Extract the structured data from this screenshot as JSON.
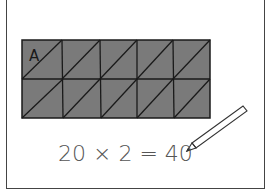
{
  "diagram": {
    "grid": {
      "rows": 2,
      "cols": 5,
      "fill": "#7a7a7a",
      "stroke": "#1a1a1a",
      "label": "A",
      "diagonal": "bottom-left to top-right in every cell"
    },
    "equation": "20 × 2 = 40",
    "pencil": "pencil-icon"
  }
}
